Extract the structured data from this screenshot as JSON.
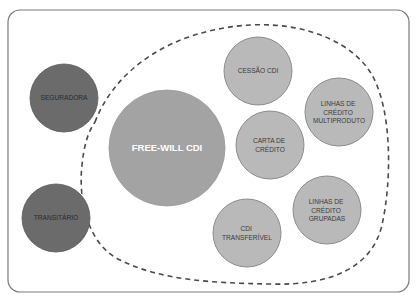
{
  "diagram": {
    "title": "",
    "outside_nodes": [
      {
        "id": "seguradora",
        "lines": [
          "SEGURADORA"
        ],
        "style": "dark"
      },
      {
        "id": "transitario",
        "lines": [
          "TRANSITÁRIO"
        ],
        "style": "dark"
      }
    ],
    "group": {
      "name": "free-will-cdi-group",
      "boundary": "dashed",
      "center_node": {
        "id": "free-will-cdi",
        "lines": [
          "FREE-WILL CDI"
        ],
        "style": "main"
      },
      "nodes": [
        {
          "id": "cessao-cdi",
          "lines": [
            "CESSÃO CDI"
          ],
          "style": "light"
        },
        {
          "id": "linhas-credito-multiproduto",
          "lines": [
            "LINHAS DE",
            "CRÉDITO",
            "MULTIPRODUTO"
          ],
          "style": "light"
        },
        {
          "id": "carta-de-credito",
          "lines": [
            "CARTA DE",
            "CRÉDITO"
          ],
          "style": "light"
        },
        {
          "id": "cdi-transferivel",
          "lines": [
            "CDI",
            "TRANSFERÍVEL"
          ],
          "style": "light"
        },
        {
          "id": "linhas-credito-grupadas",
          "lines": [
            "LINHAS DE",
            "CRÉDITO",
            "GRUPADAS"
          ],
          "style": "light"
        }
      ]
    },
    "colors": {
      "dark_node": "#6b6b6b",
      "main_node": "#a3a3a3",
      "light_node": "#b9b9b9",
      "boundary": "#4a4a4a",
      "frame": "#7a7a7a"
    }
  }
}
